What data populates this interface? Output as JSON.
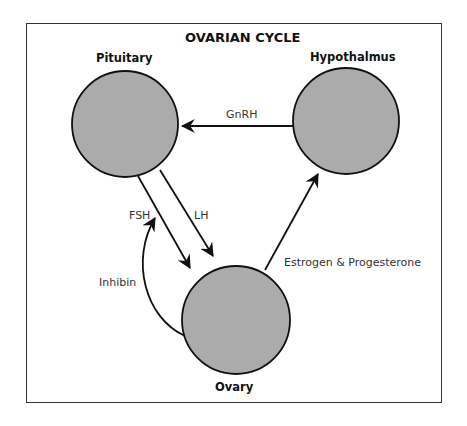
{
  "title": "OVARIAN CYCLE",
  "nodes": {
    "pituitary": {
      "label": "Pituitary",
      "cx": 125,
      "cy": 124,
      "r": 53
    },
    "hypothalmus": {
      "label": "Hypothalmus",
      "cx": 346,
      "cy": 121,
      "r": 53
    },
    "ovary": {
      "label": "Ovary",
      "cx": 236,
      "cy": 320,
      "r": 54
    }
  },
  "edges": [
    {
      "id": "gnrh",
      "from": "Hypothalmus",
      "to": "Pituitary",
      "label": "GnRH"
    },
    {
      "id": "fsh",
      "from": "Pituitary",
      "to": "Ovary",
      "label": "FSH"
    },
    {
      "id": "lh",
      "from": "Pituitary",
      "to": "Ovary",
      "label": "LH"
    },
    {
      "id": "inhibin",
      "from": "Ovary",
      "to": "FSH",
      "label": "Inhibin"
    },
    {
      "id": "estrogen",
      "from": "Ovary",
      "to": "Hypothalmus",
      "label": "Estrogen & Progesterone"
    }
  ],
  "colors": {
    "node_fill": "#ababab",
    "stroke": "#111111",
    "frame": "#333333"
  }
}
